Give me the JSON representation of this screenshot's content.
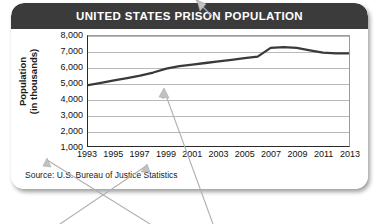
{
  "card": {
    "header_title": "UNITED STATES PRISON POPULATION",
    "source_note": "Source: U.S. Bureau of Justice Statistics",
    "header_bg": "#3b3b3b",
    "header_text_color": "#ffffff",
    "line_color": "#3a3a3a",
    "grid_color": "#b9b9b9",
    "axis_color": "#2a2a2a"
  },
  "axis": {
    "y_title_line1": "Population",
    "y_title_line2": "(in thousands)"
  },
  "chart_data": {
    "type": "line",
    "title": "UNITED STATES PRISON POPULATION",
    "xlabel": "",
    "ylabel": "Population (in thousands)",
    "ylim": [
      1000,
      8000
    ],
    "xlim": [
      1993,
      2013
    ],
    "grid": true,
    "legend": "none",
    "ytick_labels": [
      "8,000",
      "7,000",
      "6,000",
      "5,000",
      "4,000",
      "3,000",
      "2,000",
      "1,000"
    ],
    "ytick_values": [
      8000,
      7000,
      6000,
      5000,
      4000,
      3000,
      2000,
      1000
    ],
    "xtick_labels": [
      "1993",
      "1995",
      "1997",
      "1999",
      "2001",
      "2003",
      "2005",
      "2007",
      "2009",
      "2011",
      "2013"
    ],
    "xtick_values": [
      1993,
      1995,
      1997,
      1999,
      2001,
      2003,
      2005,
      2007,
      2009,
      2011,
      2013
    ],
    "x": [
      1993,
      1994,
      1995,
      1996,
      1997,
      1998,
      1999,
      2000,
      2001,
      2002,
      2003,
      2004,
      2005,
      2006,
      2007,
      2008,
      2009,
      2010,
      2011,
      2012,
      2013
    ],
    "values": [
      4900,
      5050,
      5200,
      5350,
      5500,
      5700,
      5950,
      6100,
      6200,
      6300,
      6400,
      6500,
      6600,
      6700,
      7250,
      7300,
      7250,
      7100,
      6950,
      6900,
      6900
    ],
    "series": [
      {
        "name": "U.S. prison population",
        "values": [
          4900,
          5050,
          5200,
          5350,
          5500,
          5700,
          5950,
          6100,
          6200,
          6300,
          6400,
          6500,
          6600,
          6700,
          7250,
          7300,
          7250,
          7100,
          6950,
          6900,
          6900
        ]
      }
    ],
    "annotations": {
      "start_value": 4900,
      "peak_value": 7300,
      "peak_year": 2008,
      "end_value": 6900,
      "end_year": 2013
    },
    "source": "Source: U.S. Bureau of Justice Statistics"
  },
  "overlay": {
    "arrow_count": 4,
    "arrow_color": "#b0b0b0"
  }
}
